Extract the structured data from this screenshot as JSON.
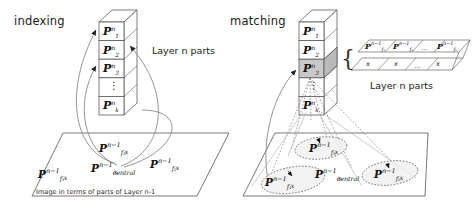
{
  "figure": {
    "type": "schematic-diagram",
    "background": "#ffffff",
    "stroke_color": "#444444",
    "highlight_fill": "#c9c9c9"
  },
  "panels": {
    "left": {
      "title": "indexing",
      "side_label": "Layer n parts",
      "plane_caption": "Image in terms of parts of Layer n-1"
    },
    "right": {
      "title": "matching",
      "side_label": "Layer n parts"
    }
  },
  "stack_left": {
    "name": "layer-n-parts-stack",
    "cells": [
      {
        "P": "P",
        "sup": "n",
        "sub": "1"
      },
      {
        "P": "P",
        "sup": "n",
        "sub": "2"
      },
      {
        "P": "P",
        "sup": "n",
        "sub": "3"
      },
      {
        "P": "⋮",
        "sup": "",
        "sub": ""
      },
      {
        "P": "P",
        "sup": "n",
        "sub": "k"
      }
    ],
    "highlighted_index": -1
  },
  "stack_right": {
    "name": "layer-n-parts-stack",
    "cells": [
      {
        "P": "P",
        "sup": "n",
        "sub": "1"
      },
      {
        "P": "P",
        "sup": "n",
        "sub": "2"
      },
      {
        "P": "P",
        "sup": "n",
        "sub": "3"
      },
      {
        "P": "⋮",
        "sup": "",
        "sub": ""
      },
      {
        "P": "P",
        "sup": "n",
        "sub": "k"
      }
    ],
    "highlighted_index": 2
  },
  "plane_left": {
    "name": "image-plane-layer-n-minus-1",
    "labels": [
      {
        "P": "P",
        "sup": "n−1",
        "sub": "f₃",
        "sub2": "x",
        "id": "p-f3"
      },
      {
        "P": "P",
        "sup": "n−1",
        "sub": "central",
        "sub2": "x",
        "id": "p-central"
      },
      {
        "P": "P",
        "sup": "n−1",
        "sub": "f₁",
        "sub2": "x",
        "id": "p-f1"
      },
      {
        "P": "P",
        "sup": "n−1",
        "sub": "f₂",
        "sub2": "x",
        "id": "p-f2"
      }
    ]
  },
  "plane_right": {
    "name": "image-plane-layer-n-minus-1",
    "labels": [
      {
        "P": "P",
        "sup": "n−1",
        "sub": "f₃",
        "sub2": "x",
        "id": "p-f3"
      },
      {
        "P": "P",
        "sup": "n−1",
        "sub": "central",
        "sub2": "x",
        "id": "p-central"
      },
      {
        "P": "P",
        "sup": "n−1",
        "sub": "f₁",
        "sub2": "x",
        "id": "p-f1"
      },
      {
        "P": "P",
        "sup": "n−1",
        "sub": "f₂",
        "sub2": "x",
        "id": "p-f2"
      }
    ],
    "ellipse_count": 3
  },
  "parts_table": {
    "name": "layer-n-parts-table",
    "row_top": [
      {
        "P": "P",
        "sup": "n−1",
        "sub": "f₁"
      },
      {
        "P": "P",
        "sup": "n−1",
        "sub": "f₂"
      },
      {
        "P": "…",
        "sup": "",
        "sub": ""
      },
      {
        "P": "P",
        "sup": "n−1",
        "sub": "fₖ"
      }
    ],
    "row_bottom": [
      "x",
      "x",
      "…",
      "x"
    ],
    "brace": "{"
  }
}
